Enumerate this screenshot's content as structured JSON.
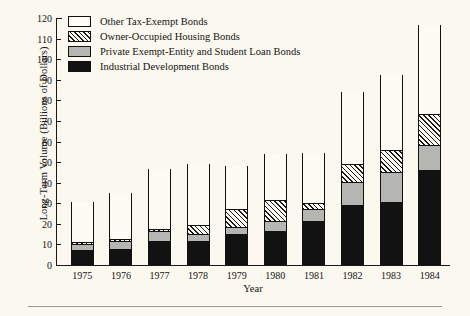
{
  "figure": {
    "background_color": "#faf8ef",
    "axis_color": "#1a1a1a",
    "xaxis_title": "Year",
    "yaxis_title": "Long-Term Volume (Billions of Dollars)"
  },
  "legend": {
    "position": "top-left-inside",
    "entries": [
      {
        "label": "Other Tax-Exempt Bonds",
        "swatch": "open-white-swatch",
        "fill": "#fdfcf6"
      },
      {
        "label": "Owner-Occupied Housing Bonds",
        "swatch": "diagonal-hatch-swatch",
        "fill": "hatch"
      },
      {
        "label": "Private Exempt-Entity and Student Loan Bonds",
        "swatch": "gray-swatch",
        "fill": "#b5b5b2"
      },
      {
        "label": "Industrial Development Bonds",
        "swatch": "black-swatch",
        "fill": "#121212"
      }
    ]
  },
  "chart_data": {
    "type": "bar",
    "subtype": "stacked-vertical",
    "title": "",
    "xlabel": "Year",
    "ylabel": "Long-Term Volume (Billions of Dollars)",
    "ylim": [
      0,
      120
    ],
    "yticks": [
      0,
      10,
      20,
      30,
      40,
      50,
      60,
      70,
      80,
      90,
      100,
      110,
      120
    ],
    "ytick_labels": [
      "0",
      "10",
      "20",
      "30",
      "40",
      "50",
      "60",
      "70",
      "80",
      "90",
      "100",
      "110",
      "120"
    ],
    "grid": false,
    "legend_position": "upper left",
    "categories": [
      "1975",
      "1976",
      "1977",
      "1978",
      "1979",
      "1980",
      "1981",
      "1982",
      "1983",
      "1984"
    ],
    "stack_order_bottom_to_top": [
      "Industrial Development Bonds",
      "Private Exempt-Entity and Student Loan Bonds",
      "Owner-Occupied Housing Bonds",
      "Other Tax-Exempt Bonds"
    ],
    "series": [
      {
        "name": "Industrial Development Bonds",
        "fill": "#121212",
        "values": [
          7.0,
          7.5,
          11.0,
          11.0,
          14.5,
          16.0,
          21.0,
          28.5,
          30.0,
          45.5
        ]
      },
      {
        "name": "Private Exempt-Entity and Student Loan Bonds",
        "fill": "#b5b5b2",
        "values": [
          2.5,
          3.5,
          5.0,
          3.5,
          3.5,
          5.0,
          5.5,
          11.5,
          14.5,
          12.5
        ]
      },
      {
        "name": "Owner-Occupied Housing Bonds",
        "fill": "hatch",
        "values": [
          1.5,
          1.5,
          1.5,
          5.0,
          9.0,
          10.5,
          3.5,
          9.0,
          11.5,
          15.5
        ]
      },
      {
        "name": "Other Tax-Exempt Bonds",
        "fill": "#fdfcf6",
        "values": [
          19.5,
          22.5,
          29.0,
          29.5,
          21.0,
          22.5,
          24.5,
          35.0,
          36.5,
          43.0
        ]
      }
    ],
    "cumulative_tops": {
      "industrial": [
        7.0,
        7.5,
        11.0,
        11.0,
        14.5,
        16.0,
        21.0,
        28.5,
        30.0,
        45.5
      ],
      "private_student": [
        9.5,
        11.0,
        16.0,
        14.5,
        18.0,
        21.0,
        26.5,
        40.0,
        44.5,
        58.0
      ],
      "owner_housing": [
        11.0,
        12.5,
        17.5,
        19.5,
        27.0,
        31.5,
        30.0,
        49.0,
        56.0,
        73.5
      ],
      "total": [
        30.5,
        35.0,
        46.5,
        49.0,
        48.0,
        54.0,
        54.5,
        84.0,
        92.5,
        116.5
      ]
    },
    "totals": [
      30.5,
      35.0,
      46.5,
      49.0,
      48.0,
      54.0,
      54.5,
      84.0,
      92.5,
      116.5
    ]
  }
}
